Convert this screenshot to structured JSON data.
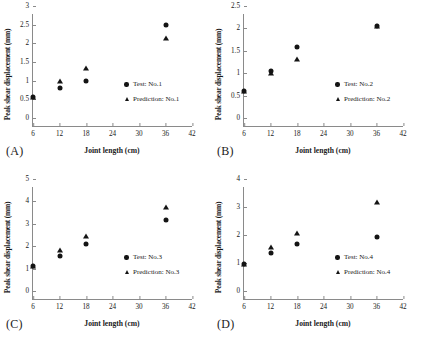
{
  "figure": {
    "axis_titles": {
      "x": "Joint length (cm)",
      "y": "Peak shear displacement (mm)"
    },
    "xticks": [
      "6",
      "12",
      "18",
      "24",
      "30",
      "36",
      "42"
    ],
    "marker_colors": {
      "test": "#141414",
      "prediction": "#141414"
    }
  },
  "panels": [
    {
      "label": "(A)",
      "yticks": [
        "0",
        "0.5",
        "1",
        "1.5",
        "2",
        "2.5",
        "3"
      ],
      "legend": {
        "test": "Test: No.1",
        "prediction": "Prediction: No.1"
      },
      "chart_data": {
        "type": "scatter",
        "title": "(A)",
        "xlabel": "Joint length (cm)",
        "ylabel": "Peak shear displacement (mm)",
        "xlim": [
          6,
          42
        ],
        "ylim": [
          0,
          3
        ],
        "xticks": [
          6,
          12,
          18,
          24,
          30,
          36,
          42
        ],
        "yticks": [
          0,
          0.5,
          1,
          1.5,
          2,
          2.5,
          3
        ],
        "grid": false,
        "legend_position": "inside-lower-right",
        "series": [
          {
            "name": "Test: No.1",
            "marker": "circle",
            "points": [
              {
                "x": 6,
                "y": 0.78
              },
              {
                "x": 12,
                "y": 1.03
              },
              {
                "x": 18,
                "y": 1.2
              },
              {
                "x": 36,
                "y": 2.7
              }
            ]
          },
          {
            "name": "Prediction: No.1",
            "marker": "triangle",
            "points": [
              {
                "x": 6,
                "y": 0.78
              },
              {
                "x": 12,
                "y": 1.2
              },
              {
                "x": 18,
                "y": 1.55
              },
              {
                "x": 36,
                "y": 2.35
              }
            ]
          }
        ]
      }
    },
    {
      "label": "(B)",
      "yticks": [
        "0",
        "0.5",
        "1",
        "1.5",
        "2",
        "2.5"
      ],
      "legend": {
        "test": "Test: No.2",
        "prediction": "Prediction: No.2"
      },
      "chart_data": {
        "type": "scatter",
        "title": "(B)",
        "xlabel": "Joint length (cm)",
        "ylabel": "Peak shear displacement (mm)",
        "xlim": [
          6,
          42
        ],
        "ylim": [
          0,
          2.5
        ],
        "xticks": [
          6,
          12,
          18,
          24,
          30,
          36,
          42
        ],
        "yticks": [
          0,
          0.5,
          1,
          1.5,
          2,
          2.5
        ],
        "grid": false,
        "legend_position": "inside-lower-right",
        "series": [
          {
            "name": "Test: No.2",
            "marker": "circle",
            "points": [
              {
                "x": 6,
                "y": 0.78
              },
              {
                "x": 12,
                "y": 1.23
              },
              {
                "x": 18,
                "y": 1.77
              },
              {
                "x": 36,
                "y": 2.23
              }
            ]
          },
          {
            "name": "Prediction: No.2",
            "marker": "triangle",
            "points": [
              {
                "x": 6,
                "y": 0.78
              },
              {
                "x": 12,
                "y": 1.19
              },
              {
                "x": 18,
                "y": 1.5
              },
              {
                "x": 36,
                "y": 2.23
              }
            ]
          }
        ]
      }
    },
    {
      "label": "(C)",
      "yticks": [
        "0",
        "1",
        "2",
        "3",
        "4",
        "5"
      ],
      "legend": {
        "test": "Test: No.3",
        "prediction": "Prediction: No.3"
      },
      "chart_data": {
        "type": "scatter",
        "title": "(C)",
        "xlabel": "Joint length (cm)",
        "ylabel": "Peak shear displacement (mm)",
        "xlim": [
          6,
          42
        ],
        "ylim": [
          0,
          5
        ],
        "xticks": [
          6,
          12,
          18,
          24,
          30,
          36,
          42
        ],
        "yticks": [
          0,
          1,
          2,
          3,
          4,
          5
        ],
        "grid": false,
        "legend_position": "inside-lower-right",
        "series": [
          {
            "name": "Test: No.3",
            "marker": "circle",
            "points": [
              {
                "x": 6,
                "y": 1.47
              },
              {
                "x": 12,
                "y": 1.92
              },
              {
                "x": 18,
                "y": 2.47
              },
              {
                "x": 36,
                "y": 3.53
              }
            ]
          },
          {
            "name": "Prediction: No.3",
            "marker": "triangle",
            "points": [
              {
                "x": 6,
                "y": 1.47
              },
              {
                "x": 12,
                "y": 2.2
              },
              {
                "x": 18,
                "y": 2.8
              },
              {
                "x": 36,
                "y": 4.13
              }
            ]
          }
        ]
      }
    },
    {
      "label": "(D)",
      "yticks": [
        "0",
        "1",
        "2",
        "3",
        "4"
      ],
      "legend": {
        "test": "Test: No.4",
        "prediction": "Prediction: No.4"
      },
      "chart_data": {
        "type": "scatter",
        "title": "(D)",
        "xlabel": "Joint length (cm)",
        "ylabel": "Peak shear displacement (mm)",
        "xlim": [
          6,
          42
        ],
        "ylim": [
          0,
          4
        ],
        "xticks": [
          6,
          12,
          18,
          24,
          30,
          36,
          42
        ],
        "yticks": [
          0,
          1,
          2,
          3,
          4
        ],
        "grid": false,
        "legend_position": "inside-lower-right",
        "series": [
          {
            "name": "Test: No.4",
            "marker": "circle",
            "points": [
              {
                "x": 6,
                "y": 1.25
              },
              {
                "x": 12,
                "y": 1.63
              },
              {
                "x": 18,
                "y": 1.95
              },
              {
                "x": 36,
                "y": 2.2
              }
            ]
          },
          {
            "name": "Prediction: No.4",
            "marker": "triangle",
            "points": [
              {
                "x": 6,
                "y": 1.25
              },
              {
                "x": 12,
                "y": 1.87
              },
              {
                "x": 18,
                "y": 2.35
              },
              {
                "x": 36,
                "y": 3.47
              }
            ]
          }
        ]
      }
    }
  ]
}
